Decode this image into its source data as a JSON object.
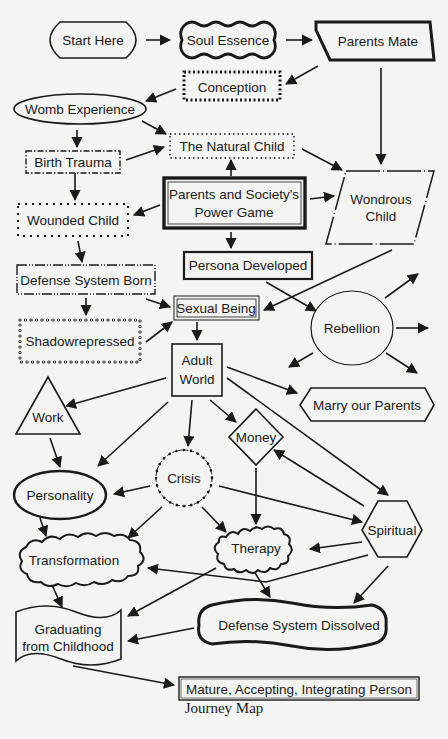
{
  "diagram": {
    "title": "Journey Map",
    "nodes": {
      "start_here": "Start Here",
      "soul_essence": "Soul Essence",
      "parents_mate": "Parents Mate",
      "conception": "Conception",
      "womb_experience": "Womb Experience",
      "natural_child": "The Natural Child",
      "birth_trauma": "Birth Trauma",
      "power_game_1": "Parents and Society's",
      "power_game_2": "Power Game",
      "wondrous_child_1": "Wondrous",
      "wondrous_child_2": "Child",
      "wounded_child": "Wounded Child",
      "persona_developed": "Persona Developed",
      "defense_system_born": "Defense System Born",
      "sexual_being": "Sexual Being",
      "rebellion": "Rebellion",
      "shadowrepressed": "Shadowrepressed",
      "adult_world_1": "Adult",
      "adult_world_2": "World",
      "work": "Work",
      "marry_our_parents": "Marry our Parents",
      "money": "Money",
      "crisis": "Crisis",
      "personality": "Personality",
      "spiritual": "Spiritual",
      "therapy": "Therapy",
      "transformation": "Transformation",
      "graduating_1": "Graduating",
      "graduating_2": "from Childhood",
      "defense_system_dissolved": "Defense System Dissolved",
      "mature_person": "Mature, Accepting, Integrating Person"
    },
    "edges": [
      [
        "Start Here",
        "Soul Essence"
      ],
      [
        "Soul Essence",
        "Parents Mate"
      ],
      [
        "Parents Mate",
        "Conception"
      ],
      [
        "Parents Mate",
        "Wondrous Child"
      ],
      [
        "Conception",
        "Womb Experience"
      ],
      [
        "Womb Experience",
        "Birth Trauma"
      ],
      [
        "Womb Experience",
        "The Natural Child"
      ],
      [
        "Birth Trauma",
        "The Natural Child"
      ],
      [
        "Birth Trauma",
        "Wounded Child"
      ],
      [
        "The Natural Child",
        "Wondrous Child"
      ],
      [
        "Parents and Society's Power Game",
        "The Natural Child"
      ],
      [
        "Parents and Society's Power Game",
        "Wondrous Child"
      ],
      [
        "Parents and Society's Power Game",
        "Wounded Child"
      ],
      [
        "Parents and Society's Power Game",
        "Persona Developed"
      ],
      [
        "Wounded Child",
        "Defense System Born"
      ],
      [
        "Defense System Born",
        "Shadowrepressed"
      ],
      [
        "Defense System Born",
        "Sexual Being"
      ],
      [
        "Shadowrepressed",
        "Sexual Being"
      ],
      [
        "Wondrous Child",
        "Sexual Being"
      ],
      [
        "Persona Developed",
        "Rebellion"
      ],
      [
        "Sexual Being",
        "Adult World"
      ],
      [
        "Adult World",
        "Work"
      ],
      [
        "Adult World",
        "Marry our Parents"
      ],
      [
        "Adult World",
        "Money"
      ],
      [
        "Adult World",
        "Crisis"
      ],
      [
        "Adult World",
        "Personality"
      ],
      [
        "Adult World",
        "Spiritual"
      ],
      [
        "Work",
        "Personality"
      ],
      [
        "Crisis",
        "Personality"
      ],
      [
        "Crisis",
        "Transformation"
      ],
      [
        "Crisis",
        "Therapy"
      ],
      [
        "Crisis",
        "Spiritual"
      ],
      [
        "Money",
        "Therapy"
      ],
      [
        "Spiritual",
        "Money"
      ],
      [
        "Spiritual",
        "Therapy"
      ],
      [
        "Spiritual",
        "Transformation"
      ],
      [
        "Spiritual",
        "Defense System Dissolved"
      ],
      [
        "Personality",
        "Transformation"
      ],
      [
        "Therapy",
        "Defense System Dissolved"
      ],
      [
        "Therapy",
        "Graduating from Childhood"
      ],
      [
        "Transformation",
        "Graduating from Childhood"
      ],
      [
        "Defense System Dissolved",
        "Graduating from Childhood"
      ],
      [
        "Graduating from Childhood",
        "Mature, Accepting, Integrating Person"
      ]
    ]
  }
}
